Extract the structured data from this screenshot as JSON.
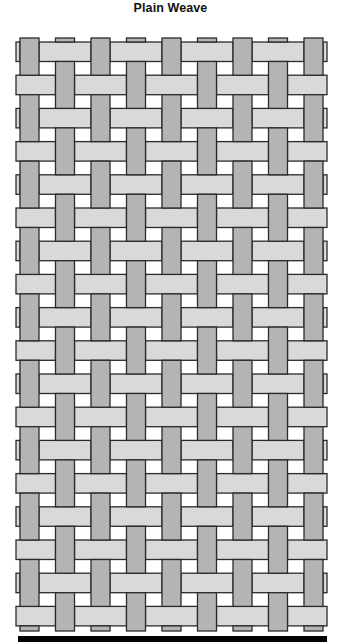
{
  "title": "Plain Weave",
  "weave": {
    "pattern": "plain",
    "warp_count": 9,
    "weft_count": 18,
    "first_warp_over_first_weft": true,
    "colors": {
      "warp": "#b4b4b4",
      "weft": "#d9d9d9",
      "outline": "#2a2a2a",
      "background": "#ffffff",
      "base_bar": "#000000"
    }
  }
}
